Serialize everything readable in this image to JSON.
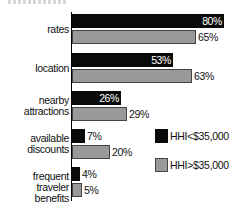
{
  "chart_data": {
    "type": "bar",
    "orientation": "horizontal",
    "title": "",
    "categories": [
      "rates",
      "location",
      "nearby attractions",
      "available discounts",
      "frequent traveler benefits"
    ],
    "category_lines": [
      [
        "rates"
      ],
      [
        "location"
      ],
      [
        "nearby",
        "attractions"
      ],
      [
        "available",
        "discounts"
      ],
      [
        "frequent",
        "traveler benefits"
      ]
    ],
    "series": [
      {
        "name": "HHI<$35,000",
        "color": "#0a0a0a",
        "values": [
          80,
          53,
          26,
          7,
          4
        ],
        "labels": [
          "80%",
          "53%",
          "26%",
          "7%",
          "4%"
        ]
      },
      {
        "name": "HHI>$35,000",
        "color": "#d8d8d8",
        "pattern": "dotted",
        "values": [
          65,
          63,
          29,
          20,
          5
        ],
        "labels": [
          "65%",
          "63%",
          "29%",
          "20%",
          "5%"
        ]
      }
    ],
    "xlabel": "",
    "ylabel": "",
    "xlim": [
      0,
      80
    ],
    "grid": false,
    "legend_position": "right"
  },
  "legend": [
    "HHI<$35,000",
    "HHI>$35,000"
  ]
}
